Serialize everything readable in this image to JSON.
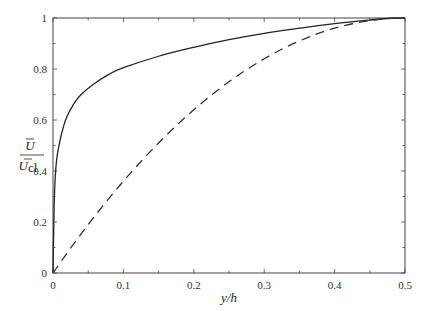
{
  "chart_data": {
    "type": "line",
    "title": "",
    "xlabel": "y/h",
    "ylabel": "Ū / Ū_cl",
    "ylabel_parts": {
      "numerator": "U",
      "denominator": "U",
      "subscript": "cl"
    },
    "xlim": [
      0,
      0.5
    ],
    "ylim": [
      0,
      1
    ],
    "x_ticks": [
      0,
      0.1,
      0.2,
      0.3,
      0.4,
      0.5
    ],
    "x_tick_labels": [
      "0",
      "0.1",
      "0.2",
      "0.3",
      "0.4",
      "0.5"
    ],
    "y_ticks": [
      0,
      0.2,
      0.4,
      0.6,
      0.8,
      1
    ],
    "y_tick_labels": [
      "0",
      "0.2",
      "0.4",
      "0.6",
      "0.8",
      "1"
    ],
    "grid": false,
    "legend": null,
    "series": [
      {
        "name": "turbulent (solid)",
        "style": "solid",
        "color": "#222222",
        "x": [
          0,
          0.002,
          0.005,
          0.01,
          0.015,
          0.02,
          0.03,
          0.04,
          0.06,
          0.08,
          0.1,
          0.15,
          0.2,
          0.25,
          0.3,
          0.35,
          0.4,
          0.45,
          0.48,
          0.5
        ],
        "values": [
          0,
          0.3,
          0.44,
          0.52,
          0.575,
          0.615,
          0.665,
          0.7,
          0.745,
          0.78,
          0.805,
          0.85,
          0.885,
          0.915,
          0.94,
          0.96,
          0.978,
          0.992,
          0.999,
          1.0
        ]
      },
      {
        "name": "laminar (dashed)",
        "style": "dashed",
        "color": "#333333",
        "x": [
          0,
          0.025,
          0.05,
          0.075,
          0.1,
          0.125,
          0.15,
          0.175,
          0.2,
          0.225,
          0.25,
          0.275,
          0.3,
          0.325,
          0.35,
          0.375,
          0.4,
          0.425,
          0.45,
          0.475,
          0.5
        ],
        "values": [
          0,
          0.0975,
          0.19,
          0.2775,
          0.36,
          0.4375,
          0.51,
          0.5775,
          0.64,
          0.6975,
          0.75,
          0.7975,
          0.84,
          0.8775,
          0.91,
          0.9375,
          0.96,
          0.9775,
          0.99,
          0.9975,
          1.0
        ]
      }
    ]
  }
}
